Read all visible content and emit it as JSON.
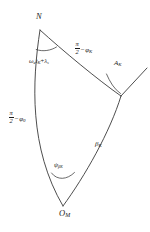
{
  "figure": {
    "type": "spherical-triangle-diagram",
    "background_color": "#ffffff",
    "stroke_color": "#3a3a3a",
    "text_color": "#1a1a1a",
    "width": 150,
    "height": 232
  },
  "vertices": [
    {
      "id": "north-pole",
      "label": "N",
      "x": 40,
      "y": 30,
      "label_x": 36,
      "label_y": 14
    },
    {
      "id": "satellite-point",
      "label": "",
      "x": 121,
      "y": 96,
      "label_x": 0,
      "label_y": 0
    },
    {
      "id": "observer-point",
      "label": "O",
      "sub": "M",
      "x": 63,
      "y": 206,
      "label_x": 60,
      "label_y": 210
    }
  ],
  "sides": [
    {
      "id": "side-north-to-observer",
      "name": "colatitude-of-observer",
      "label_pi": "π",
      "label_two": "2",
      "label_minus": "−",
      "label_phi": "φ",
      "label_phi_sub": "0",
      "label_x": 9,
      "label_y": 112
    },
    {
      "id": "side-north-to-satellite",
      "name": "colatitude-of-satellite",
      "label_pi": "π",
      "label_two": "2",
      "label_minus": "−",
      "label_phi": "φ",
      "label_phi_sub": "K",
      "label_x": 75,
      "label_y": 42
    },
    {
      "id": "side-observer-to-satellite",
      "name": "central-angle-beta",
      "label_beta": "β",
      "label_beta_sub": "K",
      "label_x": 96,
      "label_y": 142
    }
  ],
  "angles": [
    {
      "id": "angle-at-north",
      "name": "longitude-difference",
      "label_omega": "ω",
      "label_omega_sub": "e",
      "label_t": "t",
      "label_t_sub": "K",
      "label_plus": "+",
      "label_lambda": "λ",
      "label_lambda_sub": "s",
      "label_x": 30,
      "label_y": 59
    },
    {
      "id": "angle-at-satellite",
      "name": "azimuth-A-K",
      "label_A": "A",
      "label_A_sub": "K",
      "label_x": 115,
      "label_y": 62
    },
    {
      "id": "angle-at-observer",
      "name": "azimuth-psi-beta",
      "label_psi": "ψ",
      "label_psi_sub": "β",
      "label_psi_subsub": "K",
      "label_x": 55,
      "label_y": 163
    }
  ]
}
